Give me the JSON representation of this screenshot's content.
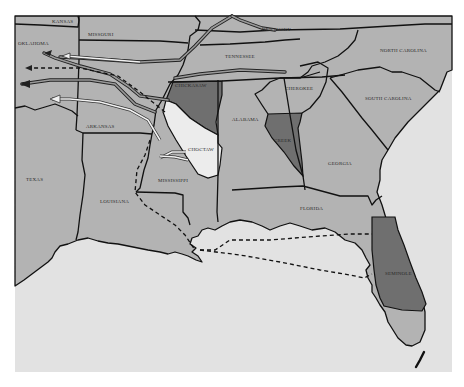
{
  "map": {
    "title": "",
    "colors": {
      "background": "#ffffff",
      "land": "#b3b3b3",
      "water": "#e2e2e2",
      "nation_dark": "#6f6f6f",
      "nation_light": "#ececec",
      "border": "#111111"
    },
    "states": [
      {
        "name": "KANSAS"
      },
      {
        "name": "MISSOURI"
      },
      {
        "name": "KENTUCKY"
      },
      {
        "name": "OKLAHOMA"
      },
      {
        "name": "TENNESSEE"
      },
      {
        "name": "NORTH CAROLINA"
      },
      {
        "name": "ARKANSAS"
      },
      {
        "name": "SOUTH CAROLINA"
      },
      {
        "name": "ALABAMA"
      },
      {
        "name": "GEORGIA"
      },
      {
        "name": "MISSISSIPPI"
      },
      {
        "name": "TEXAS"
      },
      {
        "name": "LOUISIANA"
      },
      {
        "name": "FLORIDA"
      }
    ],
    "nations": [
      {
        "name": "CHICKASAW",
        "shade": "dark"
      },
      {
        "name": "CHEROKEE",
        "shade": "none"
      },
      {
        "name": "CHOCTAW",
        "shade": "light"
      },
      {
        "name": "CREEK",
        "shade": "dark"
      },
      {
        "name": "SEMINOLE",
        "shade": "dark"
      }
    ],
    "routes": [
      {
        "name": "northern-land-route",
        "style": "double-line",
        "direction": "west"
      },
      {
        "name": "central-land-route",
        "style": "dashed",
        "direction": "west"
      },
      {
        "name": "southern-land-route",
        "style": "double-line",
        "direction": "west"
      },
      {
        "name": "arkansas-river-route",
        "style": "white-double-line",
        "direction": "west"
      },
      {
        "name": "gulf-water-route",
        "style": "dashed",
        "direction": "west"
      }
    ]
  }
}
